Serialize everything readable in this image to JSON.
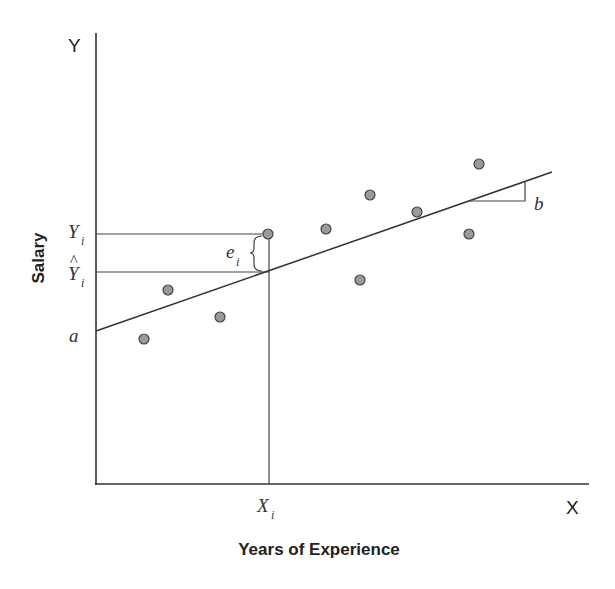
{
  "diagram": {
    "type": "scatter-with-regression-line",
    "x_axis": {
      "letter": "X",
      "title": "Years of Experience"
    },
    "y_axis": {
      "letter": "Y",
      "title": "Salary"
    },
    "labels": {
      "intercept": "a",
      "slope": "b",
      "observed_y": {
        "base": "Y",
        "sub": "i"
      },
      "predicted_y": {
        "base": "Y",
        "sub": "i",
        "hat": "^"
      },
      "residual": {
        "base": "e",
        "sub": "i"
      },
      "x_value": {
        "base": "X",
        "sub": "i"
      }
    },
    "colors": {
      "line": "#333333",
      "point_fill": "#9a9a9a",
      "point_stroke": "#444444",
      "text": "#222222"
    },
    "points_px": [
      {
        "x": 144,
        "y": 339
      },
      {
        "x": 168,
        "y": 290
      },
      {
        "x": 220,
        "y": 317
      },
      {
        "x": 268,
        "y": 234
      },
      {
        "x": 326,
        "y": 229
      },
      {
        "x": 360,
        "y": 280
      },
      {
        "x": 370,
        "y": 195
      },
      {
        "x": 417,
        "y": 212
      },
      {
        "x": 469,
        "y": 234
      },
      {
        "x": 479,
        "y": 164
      }
    ],
    "regression_line_px": {
      "x1": 96,
      "y1": 331,
      "x2": 552,
      "y2": 172
    }
  }
}
